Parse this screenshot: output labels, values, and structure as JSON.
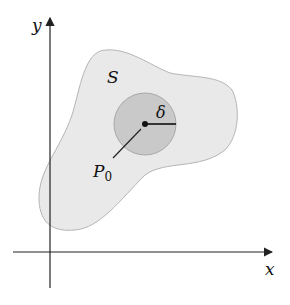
{
  "axes": {
    "x_label": "x",
    "y_label": "y"
  },
  "region": {
    "label": "S",
    "fill": "#e9e9e9",
    "stroke": "#b5b5b5"
  },
  "disk": {
    "fill": "#c9c9c9",
    "stroke": "#a9a9a9",
    "radius_label": "δ"
  },
  "point": {
    "label": "P",
    "subscript": "0"
  }
}
